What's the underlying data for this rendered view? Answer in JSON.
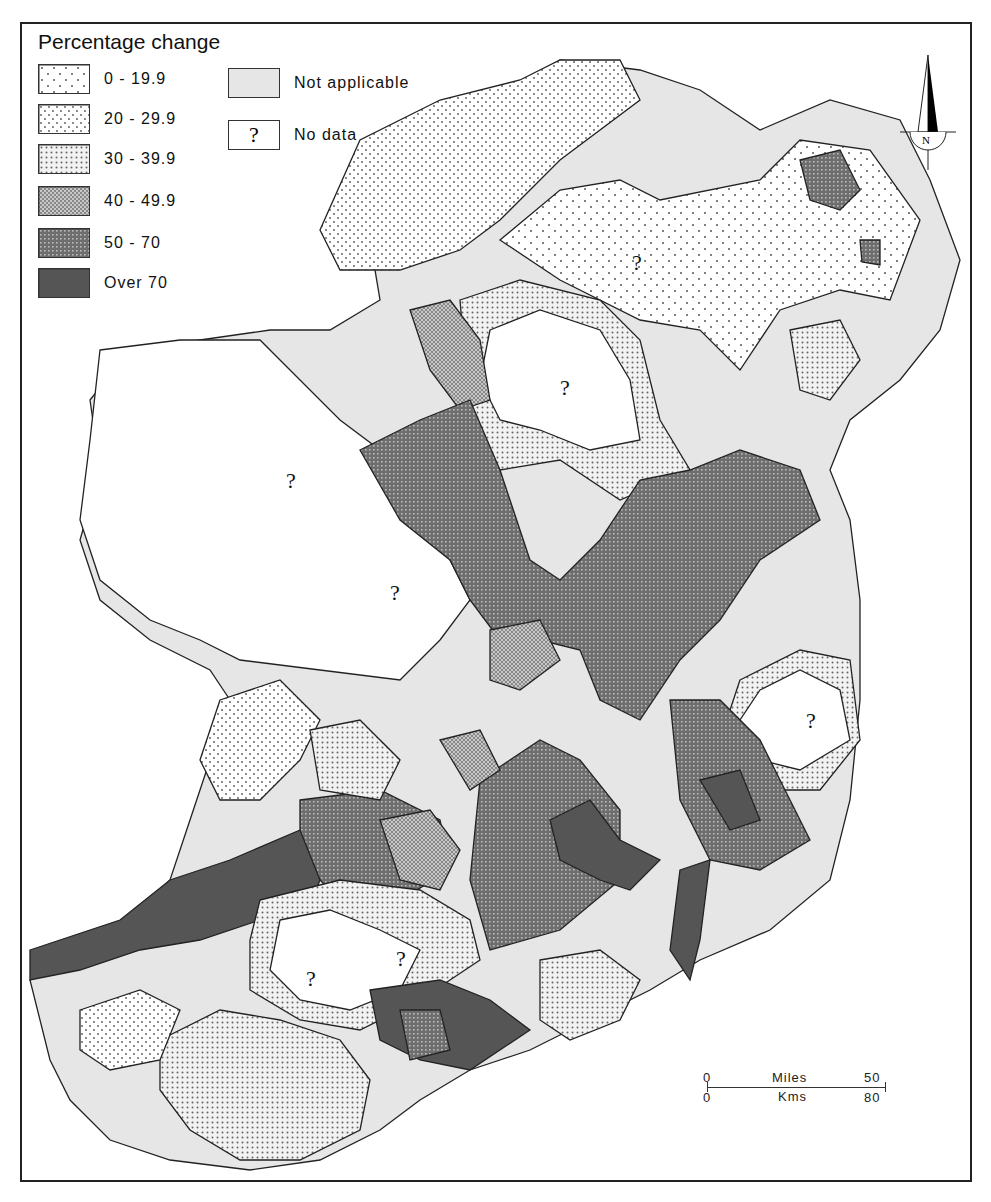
{
  "legend": {
    "title": "Percentage change",
    "items": [
      {
        "label": "0 - 19.9",
        "pattern": "sparse-dots"
      },
      {
        "label": "20 - 29.9",
        "pattern": "light-dots"
      },
      {
        "label": "30 - 39.9",
        "pattern": "medium-dots"
      },
      {
        "label": "40 - 49.9",
        "pattern": "fine-crosshatch"
      },
      {
        "label": "50 - 70",
        "pattern": "dense-dark-dots"
      },
      {
        "label": "Over 70",
        "pattern": "solid-dark"
      }
    ],
    "extra": [
      {
        "label": "Not applicable",
        "pattern": "light-grey"
      },
      {
        "label": "No data",
        "symbol": "?"
      }
    ]
  },
  "map": {
    "no_data_marks": [
      "?",
      "?",
      "?",
      "?",
      "?",
      "?",
      "?"
    ]
  },
  "scale": {
    "miles_start": "0",
    "miles_label": "Miles",
    "miles_end": "50",
    "kms_start": "0",
    "kms_label": "Kms",
    "kms_end": "80"
  },
  "north_arrow": {
    "label": "N"
  },
  "colors": {
    "not_applicable": "#e6e6e6",
    "over_70": "#555555",
    "band_50_70": "#7a7a7a",
    "band_40_50": "#a8a8a8",
    "outline": "#222222"
  }
}
